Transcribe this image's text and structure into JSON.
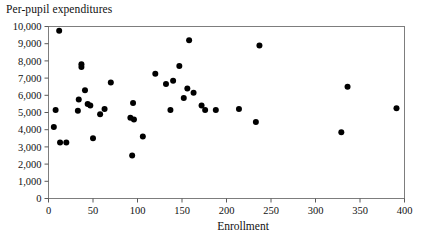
{
  "chart_data": {
    "type": "scatter",
    "title": "Per-pupil expenditures",
    "subtitle": "",
    "xlabel": "Enrollment",
    "ylabel": "Per-pupil expenditures",
    "xlim": [
      0,
      400
    ],
    "ylim": [
      0,
      10000
    ],
    "xticks": [
      0,
      50,
      100,
      150,
      200,
      250,
      300,
      350,
      400
    ],
    "xtick_labels": [
      "0",
      "50",
      "100",
      "150",
      "200",
      "250",
      "300",
      "350",
      "400"
    ],
    "yticks": [
      0,
      1000,
      2000,
      3000,
      4000,
      5000,
      6000,
      7000,
      8000,
      9000,
      10000
    ],
    "ytick_labels": [
      "0",
      "1,000",
      "2,000",
      "3,000",
      "4,000",
      "5,000",
      "6,000",
      "7,000",
      "8,000",
      "9,000",
      "10,000"
    ],
    "grid": false,
    "legend": null,
    "marker_color": "#000000",
    "marker_size": 3,
    "points": [
      {
        "x": 6,
        "y": 4150
      },
      {
        "x": 8,
        "y": 5150
      },
      {
        "x": 12,
        "y": 9750
      },
      {
        "x": 13,
        "y": 3250
      },
      {
        "x": 20,
        "y": 3250
      },
      {
        "x": 33,
        "y": 5100
      },
      {
        "x": 34,
        "y": 5750
      },
      {
        "x": 37,
        "y": 7800
      },
      {
        "x": 37,
        "y": 7650
      },
      {
        "x": 41,
        "y": 6300
      },
      {
        "x": 44,
        "y": 5500
      },
      {
        "x": 47,
        "y": 5400
      },
      {
        "x": 50,
        "y": 3500
      },
      {
        "x": 58,
        "y": 4900
      },
      {
        "x": 63,
        "y": 5200
      },
      {
        "x": 70,
        "y": 6750
      },
      {
        "x": 92,
        "y": 4700
      },
      {
        "x": 94,
        "y": 2500
      },
      {
        "x": 95,
        "y": 5550
      },
      {
        "x": 96,
        "y": 4600
      },
      {
        "x": 106,
        "y": 3600
      },
      {
        "x": 120,
        "y": 7250
      },
      {
        "x": 132,
        "y": 6650
      },
      {
        "x": 137,
        "y": 5150
      },
      {
        "x": 140,
        "y": 6850
      },
      {
        "x": 147,
        "y": 7700
      },
      {
        "x": 152,
        "y": 5850
      },
      {
        "x": 156,
        "y": 6400
      },
      {
        "x": 158,
        "y": 9200
      },
      {
        "x": 163,
        "y": 6150
      },
      {
        "x": 172,
        "y": 5400
      },
      {
        "x": 176,
        "y": 5150
      },
      {
        "x": 188,
        "y": 5150
      },
      {
        "x": 214,
        "y": 5200
      },
      {
        "x": 233,
        "y": 4450
      },
      {
        "x": 237,
        "y": 8900
      },
      {
        "x": 329,
        "y": 3850
      },
      {
        "x": 336,
        "y": 6500
      },
      {
        "x": 391,
        "y": 5250
      }
    ]
  }
}
